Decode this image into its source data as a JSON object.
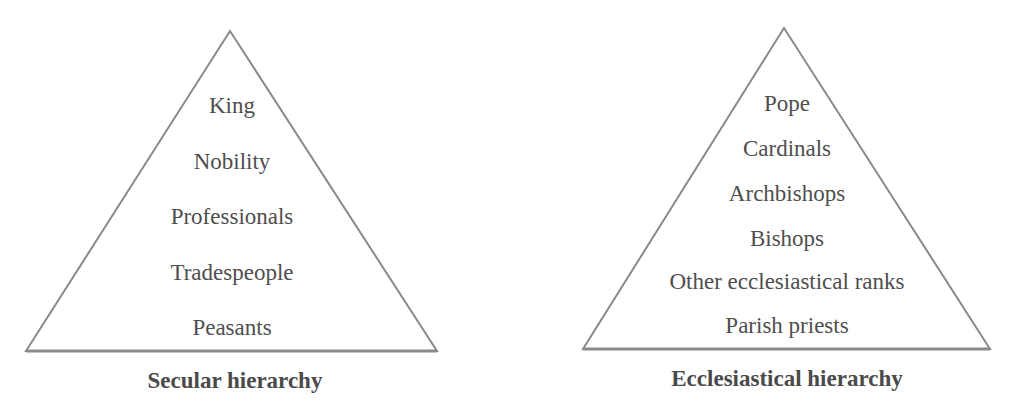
{
  "diagram": {
    "stroke_color": "#8a8a8a",
    "text_color": "#4a4a4a",
    "pyramids": [
      {
        "caption": "Secular hierarchy",
        "levels": [
          "King",
          "Nobility",
          "Professionals",
          "Tradespeople",
          "Peasants"
        ]
      },
      {
        "caption": "Ecclesiastical hierarchy",
        "levels": [
          "Pope",
          "Cardinals",
          "Archbishops",
          "Bishops",
          "Other ecclesiastical ranks",
          "Parish priests"
        ]
      }
    ]
  }
}
